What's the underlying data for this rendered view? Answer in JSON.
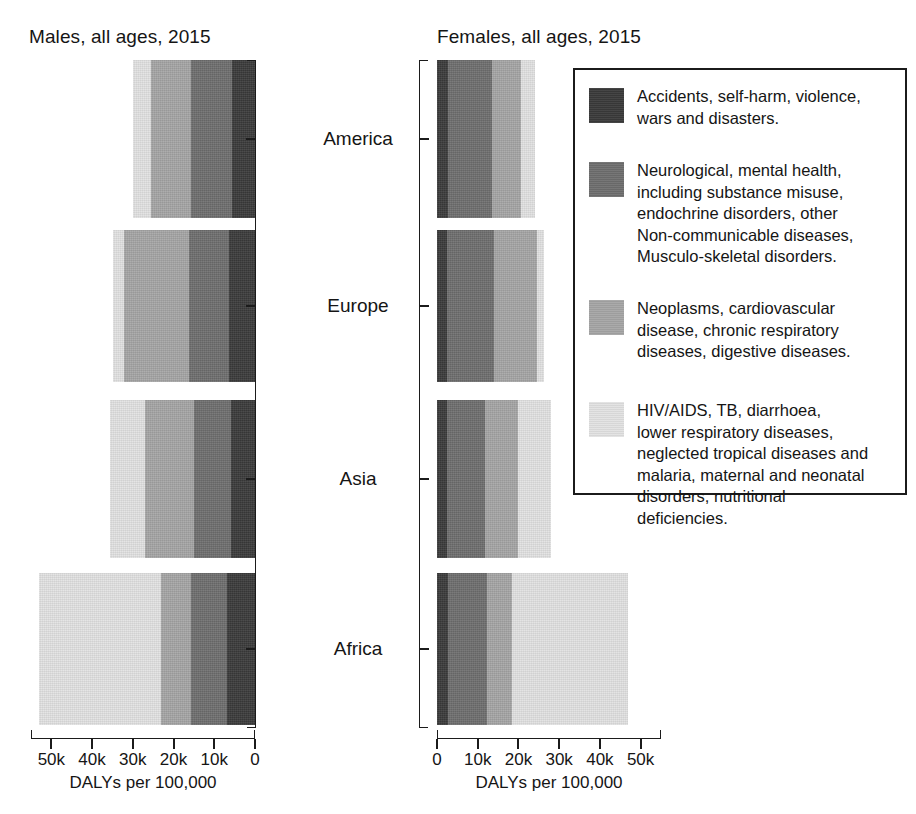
{
  "figure": {
    "panels": [
      {
        "id": "male",
        "title": "Males, all ages, 2015"
      },
      {
        "id": "female",
        "title": "Females, all ages, 2015"
      }
    ],
    "axis_caption": "DALYs per 100,000",
    "categories": [
      "America",
      "Europe",
      "Asia",
      "Africa"
    ],
    "tick_labels_male": [
      "50k",
      "40k",
      "30k",
      "20k",
      "10k",
      "0"
    ],
    "tick_labels_female": [
      "0",
      "10k",
      "20k",
      "30k",
      "40k",
      "50k"
    ],
    "colors": {
      "accidents": "#3a3a3a",
      "neurological": "#6e6e6e",
      "neoplasms": "#a5a5a5",
      "infectious": "#e2e2e2",
      "axis": "#1b1b1b",
      "text": "#151515",
      "background": "#ffffff"
    }
  },
  "legend": {
    "items": [
      {
        "key": "accidents",
        "color": "#3a3a3a",
        "text": "Accidents, self-harm, violence,\nwars and disasters."
      },
      {
        "key": "neurological",
        "color": "#6e6e6e",
        "text": "Neurological, mental health,\nincluding substance misuse,\nendochrine disorders, other\nNon-communicable diseases,\nMusculo-skeletal disorders."
      },
      {
        "key": "neoplasms",
        "color": "#a5a5a5",
        "text": "Neoplasms, cardiovascular\ndisease, chronic respiratory\ndiseases, digestive diseases."
      },
      {
        "key": "infectious",
        "color": "#e2e2e2",
        "text": "HIV/AIDS, TB, diarrhoea,\nlower respiratory diseases,\nneglected tropical diseases and\nmalaria, maternal and neonatal\ndisorders, nutritional\ndeficiencies."
      }
    ]
  },
  "chart_data": {
    "type": "bar",
    "orientation": "horizontal-stacked-mirrored",
    "xlabel": "DALYs per 100,000",
    "ylabel": "",
    "xlim": [
      0,
      55000
    ],
    "xticks": [
      0,
      10000,
      20000,
      30000,
      40000,
      50000
    ],
    "xticklabels": [
      "0",
      "10k",
      "20k",
      "30k",
      "40k",
      "50k"
    ],
    "grid": false,
    "legend_position": "right",
    "categories": [
      "America",
      "Europe",
      "Asia",
      "Africa"
    ],
    "panels": [
      {
        "name": "Males, all ages, 2015",
        "direction": "right-to-left",
        "series": [
          {
            "name": "Accidents, self-harm, violence, wars and disasters.",
            "color": "#3a3a3a",
            "values": [
              5600,
              6300,
              5900,
              6800
            ]
          },
          {
            "name": "Neurological, mental health, including substance misuse, endochrine disorders, other Non-communicable diseases, Musculo-skeletal disorders.",
            "color": "#6e6e6e",
            "values": [
              10000,
              10000,
              9000,
              9000
            ]
          },
          {
            "name": "Neoplasms, cardiovascular disease, chronic respiratory diseases, digestive diseases.",
            "color": "#a5a5a5",
            "values": [
              10000,
              15900,
              12200,
              7300
            ]
          },
          {
            "name": "HIV/AIDS, TB, diarrhoea, lower respiratory diseases, neglected tropical diseases and malaria, maternal and neonatal disorders, nutritional deficiencies.",
            "color": "#e2e2e2",
            "values": [
              4400,
              2700,
              8500,
              30000
            ]
          }
        ],
        "totals": [
          30000,
          34900,
          35600,
          53100
        ]
      },
      {
        "name": "Females, all ages, 2015",
        "direction": "left-to-right",
        "series": [
          {
            "name": "Accidents, self-harm, violence, wars and disasters.",
            "color": "#3a3a3a",
            "values": [
              2700,
              2400,
              2400,
              2700
            ]
          },
          {
            "name": "Neurological, mental health, including substance misuse, endochrine disorders, other Non-communicable diseases, Musculo-skeletal disorders.",
            "color": "#6e6e6e",
            "values": [
              10700,
              11700,
              9500,
              9500
            ]
          },
          {
            "name": "Neoplasms, cardiovascular disease, chronic respiratory diseases, digestive diseases.",
            "color": "#a5a5a5",
            "values": [
              7300,
              10500,
              8000,
              6300
            ]
          },
          {
            "name": "HIV/AIDS, TB, diarrhoea, lower respiratory diseases, neglected tropical diseases and malaria, maternal and neonatal disorders, nutritional deficiencies.",
            "color": "#e2e2e2",
            "values": [
              3400,
              1700,
              8000,
              28300
            ]
          }
        ],
        "totals": [
          24100,
          26300,
          27900,
          46800
        ]
      }
    ]
  }
}
